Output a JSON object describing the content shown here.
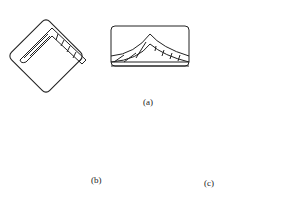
{
  "figure": {
    "labels": {
      "a": "(a)",
      "b": "(b)",
      "c": "(c)"
    },
    "colors": {
      "stroke": "#222222",
      "background": "#ffffff"
    },
    "panels": [
      {
        "id": "a1",
        "description": "rotated rounded square with chevron strip along top edges"
      },
      {
        "id": "a2",
        "description": "wide rounded rectangle with peaked curved strip"
      },
      {
        "id": "a3",
        "description": "rounded rectangle with chevron strip spanning to bottom corners"
      },
      {
        "id": "b",
        "description": "rounded rectangle with chevron strip extending beyond edges"
      },
      {
        "id": "c",
        "description": "rounded rectangle with small chevron strip inside"
      }
    ]
  }
}
